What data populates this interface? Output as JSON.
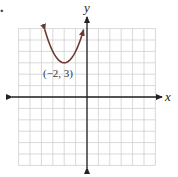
{
  "chart_data": {
    "type": "line",
    "title": "",
    "xlabel": "x",
    "ylabel": "y",
    "xlim": [
      -6,
      6
    ],
    "ylim": [
      -6,
      6
    ],
    "grid": true,
    "grid_step": 1,
    "series": [
      {
        "name": "parabola",
        "equation": "y = (x + 2)^2 + 3",
        "vertex": [
          -2,
          3
        ],
        "x": [
          -3.7,
          -3.5,
          -3,
          -2.5,
          -2,
          -1.5,
          -1,
          -0.5,
          -0.3
        ],
        "y": [
          5.89,
          5.25,
          4,
          3.25,
          3,
          3.25,
          4,
          5.25,
          5.89
        ],
        "color": "#6b3b33",
        "arrows_at_ends": true
      }
    ],
    "annotations": [
      {
        "text": "(−2, 3)",
        "x": -2,
        "y": 3
      }
    ]
  },
  "labels": {
    "x_axis": "x",
    "y_axis": "y",
    "vertex_label": "(−2, 3)",
    "bullet": "."
  }
}
